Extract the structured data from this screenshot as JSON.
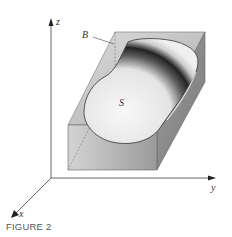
{
  "figure": {
    "caption": "FIGURE 2",
    "labels": {
      "z_axis": "z",
      "y_axis": "y",
      "x_axis": "x",
      "box": "B",
      "solid": "S"
    },
    "colors": {
      "axis": "#444444",
      "box_edge": "#666666",
      "box_fill_top": "#d0d0d0",
      "box_fill_right": "#8a8a8a",
      "box_fill_front": "#bdbdbd",
      "solid_light": "#f2f2f2",
      "solid_dark": "#2a2a2a"
    }
  }
}
